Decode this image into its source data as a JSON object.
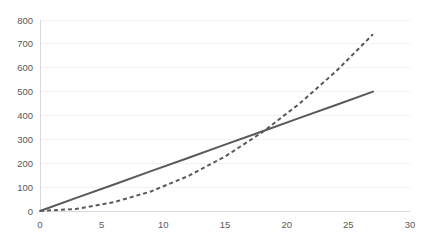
{
  "chart_data": {
    "type": "line",
    "title": "",
    "subtitle": "",
    "xlabel": "",
    "ylabel": "",
    "xlim": [
      0,
      30
    ],
    "ylim": [
      0,
      800
    ],
    "grid": true,
    "legend": "none",
    "x_ticks": [
      "0",
      "5",
      "10",
      "15",
      "20",
      "25",
      "30"
    ],
    "x_tick_values": [
      0,
      5,
      10,
      15,
      20,
      25,
      30
    ],
    "y_ticks": [
      "0",
      "100",
      "200",
      "300",
      "400",
      "500",
      "600",
      "700",
      "800"
    ],
    "y_tick_values": [
      0,
      100,
      200,
      300,
      400,
      500,
      600,
      700,
      800
    ],
    "x": [
      0,
      3,
      6,
      9,
      12,
      15,
      18,
      21,
      24,
      27
    ],
    "series": [
      {
        "name": "linear",
        "style": "solid",
        "color": "#595959",
        "values": [
          0,
          56,
          111,
          167,
          222,
          278,
          333,
          389,
          444,
          500
        ]
      },
      {
        "name": "quadratic",
        "style": "dashed",
        "color": "#595959",
        "values": [
          0,
          9,
          37,
          82,
          146,
          228,
          329,
          448,
          585,
          740
        ]
      }
    ],
    "annotations": [
      {
        "name": "intersection",
        "x": 18.5,
        "y": 343
      }
    ]
  },
  "axis": {
    "axis_color": "#d9d9d9",
    "grid_color": "#f2f2f2",
    "tick_label_color": "#595959"
  }
}
